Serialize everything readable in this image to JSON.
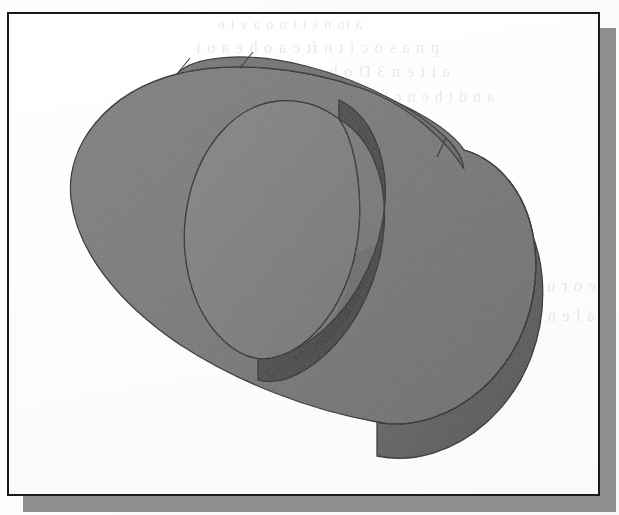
{
  "figure": {
    "kind": "shaded-3d-solid-illustration",
    "frame_border_color": "#1a1a1a",
    "frame_background_color": "#ffffff",
    "drop_shadow_color": "#8f8f8f",
    "page_background_color": "#fdfdfc",
    "frame": {
      "x": 7,
      "y": 12,
      "width": 593,
      "height": 484
    },
    "shadow_offset": {
      "x": 16,
      "y": 16
    }
  },
  "model": {
    "name": "obround-slab-with-cylindrical-boss",
    "parts": [
      {
        "id": "slab-top-face",
        "label": "Slab top face",
        "color": "#787878"
      },
      {
        "id": "slab-side-wall",
        "label": "Slab curved side wall",
        "color": "#5e5e5e"
      },
      {
        "id": "slab-back-strip",
        "label": "Slab far top edge strip",
        "color": "#6e6e6e"
      },
      {
        "id": "boss-top-face",
        "label": "Boss circular top face",
        "color": "#7e7e7e"
      },
      {
        "id": "boss-side-wall",
        "label": "Boss cylindrical wall",
        "color": "#4b4b4b"
      }
    ],
    "outline_color": "#262626",
    "palette": {
      "lightest": "#828282",
      "light": "#787878",
      "mid": "#6e6e6e",
      "dark": "#5a5a5a",
      "darkest": "#464646"
    }
  },
  "ghost_text": {
    "note": "Illegible bleed-through text from the reverse side of the scanned page",
    "lines": [
      "a in n  s t  t  n o a  v i   e",
      "p  n a s  o  c  i  t n   ft  c   a  o  b  e a  o i",
      "a  i t e n 3 D   o b j e c t    m  o  d  e  l",
      "a  n d   t h e n   c l i c k   t h e   p a r t",
      "o  n  n   e  o  r  u  n  d   t  h  e",
      "s  c  a  l  e   n  e  t  t  e  r"
    ]
  }
}
